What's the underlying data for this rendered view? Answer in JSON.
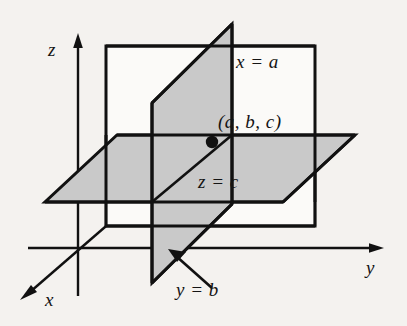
{
  "figure": {
    "background_color": "#f4f2ef",
    "line_color": "#111111",
    "plane_fill_gray": "#c9c9c9",
    "plane_fill_white": "#fbfaf8"
  },
  "axes": {
    "z": {
      "label": "z",
      "direction": "up"
    },
    "x": {
      "label": "x",
      "direction": "down-left"
    },
    "y": {
      "label": "y",
      "direction": "right"
    }
  },
  "planes": [
    {
      "id": "plane-x",
      "label": "x = a",
      "orientation": "vertical-back",
      "fill": "white"
    },
    {
      "id": "plane-z",
      "label": "z = c",
      "orientation": "horizontal",
      "fill": "gray"
    },
    {
      "id": "plane-y",
      "label": "y = b",
      "orientation": "vertical-side",
      "fill": "gray"
    }
  ],
  "point": {
    "label": "(a, b, c)",
    "marker": "filled-dot"
  },
  "annotations": {
    "leader_arrow": "arrow-pointing-to-plane-y"
  }
}
